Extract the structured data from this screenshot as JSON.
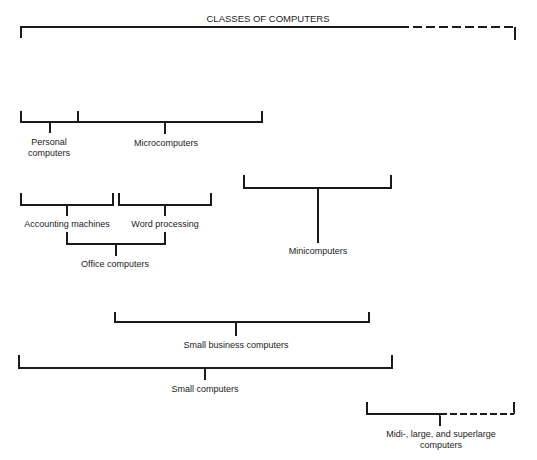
{
  "title": "CLASSES OF COMPUTERS",
  "labels": {
    "personal": "Personal",
    "personal2": "computers",
    "micro": "Microcomputers",
    "accounting": "Accounting machines",
    "word": "Word processing",
    "office": "Office computers",
    "mini": "Minicomputers",
    "small_business": "Small business computers",
    "small": "Small computers",
    "midi": "Midi-, large, and superlarge",
    "midi2": "computers"
  },
  "colors": {
    "line": "#1a1a1a",
    "background": "#ffffff"
  }
}
